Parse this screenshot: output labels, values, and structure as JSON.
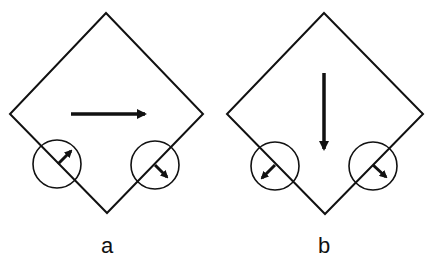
{
  "panels": [
    {
      "id": "a",
      "label": "a",
      "main_arrow_direction": "right",
      "left_sensor_arrow": "up-right",
      "right_sensor_arrow": "down-right"
    },
    {
      "id": "b",
      "label": "b",
      "main_arrow_direction": "down",
      "left_sensor_arrow": "down-left",
      "right_sensor_arrow": "down-right"
    }
  ],
  "colors": {
    "stroke": "#111111",
    "background": "#ffffff"
  }
}
